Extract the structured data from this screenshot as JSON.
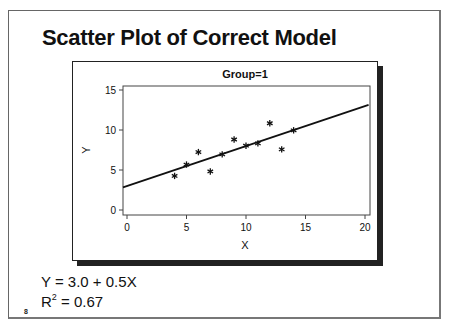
{
  "slide": {
    "title": "Scatter Plot of Correct Model",
    "equation": "Y = 3.0 + 0.5X",
    "r_squared_label": "R",
    "r_squared_sup": "2",
    "r_squared_value": " = 0.67",
    "page_number": "8"
  },
  "chart_data": {
    "type": "scatter",
    "title": "Group=1",
    "xlabel": "X",
    "ylabel": "Y",
    "xlim": [
      0,
      20
    ],
    "ylim": [
      0,
      15
    ],
    "xticks": [
      "0",
      "5",
      "10",
      "15",
      "20"
    ],
    "yticks": [
      "0",
      "5",
      "10",
      "15"
    ],
    "grid": false,
    "marker": "asterisk",
    "series": [
      {
        "name": "Group=1",
        "x": [
          4,
          5,
          6,
          7,
          8,
          9,
          10,
          11,
          12,
          13,
          14
        ],
        "y": [
          4.26,
          5.68,
          7.24,
          4.82,
          6.95,
          8.81,
          8.04,
          8.33,
          10.84,
          7.58,
          9.96
        ]
      }
    ],
    "fit_line": {
      "intercept": 3.0,
      "slope": 0.5,
      "x_range": [
        0,
        20.3
      ],
      "r_squared": 0.67
    }
  }
}
